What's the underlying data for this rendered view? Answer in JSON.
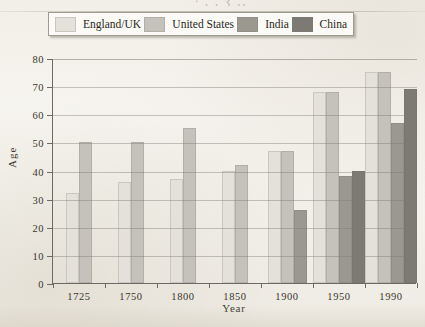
{
  "figure": {
    "title_fragment": "· , , ʒ ,,",
    "background_color": "#f4f2ec"
  },
  "legend": {
    "position": "top",
    "entries": [
      {
        "label": "England/UK",
        "color": "#e3e1da"
      },
      {
        "label": "United States",
        "color": "#c4c2ba"
      },
      {
        "label": "India",
        "color": "#9a988f"
      },
      {
        "label": "China",
        "color": "#7c7a72"
      }
    ]
  },
  "axes": {
    "y_title": "Age",
    "x_title": "Year",
    "y_ticks": [
      "0",
      "10",
      "20",
      "30",
      "40",
      "50",
      "60",
      "70",
      "80"
    ],
    "x_ticks": [
      "1725",
      "1750",
      "1800",
      "1850",
      "1900",
      "1950",
      "1990"
    ]
  },
  "chart_data": {
    "type": "bar",
    "title": "",
    "xlabel": "Year",
    "ylabel": "Age",
    "ylim": [
      0,
      80
    ],
    "ytick_step": 10,
    "grid": true,
    "legend_position": "top",
    "categories": [
      "1725",
      "1750",
      "1800",
      "1850",
      "1900",
      "1950",
      "1990"
    ],
    "series": [
      {
        "name": "England/UK",
        "color": "#e3e1da",
        "values": [
          32,
          36,
          37,
          40,
          47,
          68,
          75
        ]
      },
      {
        "name": "United States",
        "color": "#c4c2ba",
        "values": [
          50,
          50,
          55,
          42,
          47,
          68,
          75
        ]
      },
      {
        "name": "India",
        "color": "#9a988f",
        "values": [
          null,
          null,
          null,
          null,
          26,
          38,
          57
        ]
      },
      {
        "name": "China",
        "color": "#7c7a72",
        "values": [
          null,
          null,
          null,
          null,
          null,
          40,
          69
        ]
      }
    ]
  }
}
